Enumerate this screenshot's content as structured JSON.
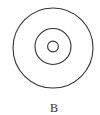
{
  "figure": {
    "label": "B",
    "stroke_color": "#333333",
    "background": "#ffffff",
    "circles": [
      {
        "name": "outer",
        "cx": 53,
        "cy": 48,
        "r": 40
      },
      {
        "name": "middle",
        "cx": 53,
        "cy": 46.5,
        "r": 18
      },
      {
        "name": "inner",
        "cx": 53,
        "cy": 46.5,
        "r": 5.4
      }
    ]
  }
}
